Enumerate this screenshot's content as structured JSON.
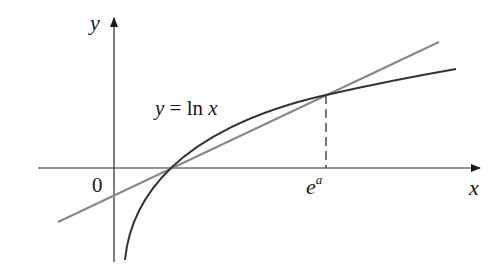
{
  "figure": {
    "y_axis_label": "y",
    "x_axis_label": "x",
    "origin_label": "0",
    "curve_label": {
      "lhs": "y",
      "eq": "=",
      "func": "ln",
      "arg": "x"
    },
    "tick_label": {
      "base": "e",
      "exponent": "a"
    }
  },
  "colors": {
    "axis": "#2a2a2a",
    "curve": "#333333",
    "tangent_line": "#888888",
    "dashed_guide": "#333333",
    "text": "#1a1a1a"
  },
  "elements": {
    "curve": "y = ln x (dark, concave)",
    "tangent_line": "line tangent to ln x at x = e^a (gray)",
    "dashed_guide": "vertical dashed line from tangent point down to x-axis at e^a"
  }
}
